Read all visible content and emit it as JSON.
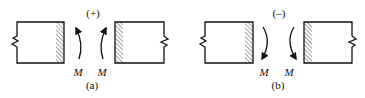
{
  "diagram": {
    "panel_a": {
      "sign": "(+)",
      "moment_left": "M",
      "moment_right": "M",
      "caption": "(a)",
      "arrow_direction": "up"
    },
    "panel_b": {
      "sign": "(–)",
      "moment_left": "M",
      "moment_right": "M",
      "caption": "(b)",
      "arrow_direction": "down"
    },
    "colors": {
      "stroke": "#111111",
      "background": "#ffffff"
    }
  }
}
